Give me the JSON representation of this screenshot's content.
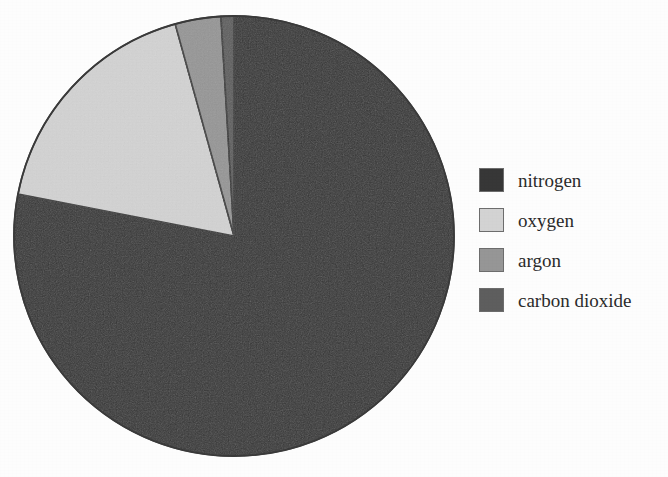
{
  "chart_data": {
    "type": "pie",
    "title": "",
    "subtitle": "",
    "xlabel": "",
    "ylabel": "",
    "grid": false,
    "legend_position": "right",
    "start_angle_deg": 0,
    "direction": "clockwise",
    "categories": [
      "nitrogen",
      "oxygen",
      "argon",
      "carbon dioxide"
    ],
    "values": [
      78.08,
      20.95,
      0.93,
      0.04
    ],
    "unit": "percent",
    "slices": [
      {
        "label": "nitrogen",
        "value": 78.08,
        "color": "#373737",
        "start_deg": 0.0,
        "end_deg": 281.1
      },
      {
        "label": "oxygen",
        "value": 20.95,
        "color": "#d3d3d3",
        "start_deg": 281.1,
        "end_deg": 356.5
      },
      {
        "label": "argon",
        "value": 0.93,
        "color": "#969696",
        "start_deg": 356.5,
        "end_deg": 359.85
      },
      {
        "label": "carbon dioxide",
        "value": 0.04,
        "color": "#5e5e5e",
        "start_deg": 359.85,
        "end_deg": 360.0
      }
    ]
  },
  "pie": {
    "center_x": 234,
    "center_y": 236,
    "radius": 220,
    "outline_color": "#3a3a3a",
    "render_slices": [
      {
        "name": "nitrogen",
        "color": "#373737",
        "start_deg": 0.0,
        "end_deg": 281.0
      },
      {
        "name": "oxygen",
        "color": "#d3d3d3",
        "start_deg": 281.0,
        "end_deg": 344.5
      },
      {
        "name": "argon",
        "color": "#969696",
        "start_deg": 344.5,
        "end_deg": 356.6
      },
      {
        "name": "carbon dioxide",
        "color": "#5e5e5e",
        "start_deg": 356.6,
        "end_deg": 360.0
      }
    ]
  },
  "legend": {
    "items": [
      {
        "label": "nitrogen",
        "color": "#373737"
      },
      {
        "label": "oxygen",
        "color": "#d3d3d3"
      },
      {
        "label": "argon",
        "color": "#969696"
      },
      {
        "label": "carbon dioxide",
        "color": "#5e5e5e"
      }
    ]
  },
  "colors": {
    "background": "#fdfdfd",
    "text": "#2b2b2b",
    "outline": "#3a3a3a"
  }
}
